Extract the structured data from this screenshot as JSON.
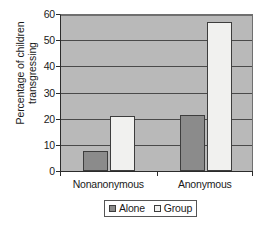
{
  "chart_data": {
    "type": "bar",
    "title": "",
    "xlabel": "",
    "ylabel": "Percentage of children transgressing",
    "ylabel_lines": [
      "Percentage of children",
      "transgressing"
    ],
    "categories": [
      "Nonanonymous",
      "Anonymous"
    ],
    "series": [
      {
        "name": "Alone",
        "values": [
          7.5,
          21.5
        ],
        "color": "#8b8b8b"
      },
      {
        "name": "Group",
        "values": [
          21,
          57
        ],
        "color": "#f1f1ef"
      }
    ],
    "ylim": [
      0,
      60
    ],
    "yticks": [
      0,
      10,
      20,
      30,
      40,
      50,
      60
    ],
    "ytick_labels": [
      "0",
      "10",
      "20",
      "30",
      "40",
      "50",
      "60"
    ],
    "grid": true,
    "grid_axis": "y",
    "legend_position": "bottom-center",
    "plot_background": "#b9b9b9",
    "figure_background": "#ffffff",
    "axis_color": "#2b2b2b"
  },
  "legend": {
    "entries": [
      {
        "label": "Alone",
        "swatch": "alone"
      },
      {
        "label": "Group",
        "swatch": "group"
      }
    ]
  },
  "axis": {
    "y_title_line1": "Percentage of children",
    "y_title_line2": "transgressing"
  }
}
